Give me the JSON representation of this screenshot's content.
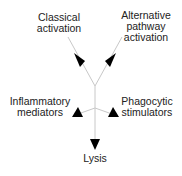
{
  "diagram": {
    "nodes": {
      "classical": {
        "line1": "Classical",
        "line2": "activation"
      },
      "alternative": {
        "line1": "Alternative",
        "line2": "pathway",
        "line3": "activation"
      },
      "inflammatory": {
        "line1": "Inflammatory",
        "line2": "mediators"
      },
      "phagocytic": {
        "line1": "Phagocytic",
        "line2": "stimulators"
      },
      "lysis": {
        "line1": "Lysis"
      }
    },
    "edges": [
      {
        "from": "classical",
        "to": "junction"
      },
      {
        "from": "alternative",
        "to": "junction"
      },
      {
        "from": "junction",
        "to": "inflammatory"
      },
      {
        "from": "junction",
        "to": "phagocytic"
      },
      {
        "from": "junction",
        "to": "lysis"
      }
    ],
    "colors": {
      "line": "#c8c8c8",
      "arrow": "#000000",
      "text": "#222222"
    }
  }
}
